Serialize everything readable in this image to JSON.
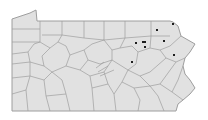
{
  "map": {
    "region": "Pennsylvania counties",
    "fill": "#e1e1e1",
    "border": "#9e9e9e",
    "dot_color": "#1e1e1e",
    "markers": [
      {
        "x": 173,
        "y": 24
      },
      {
        "x": 157,
        "y": 30
      },
      {
        "x": 136,
        "y": 43
      },
      {
        "x": 143,
        "y": 42
      },
      {
        "x": 145,
        "y": 42
      },
      {
        "x": 145,
        "y": 47
      },
      {
        "x": 164,
        "y": 41
      },
      {
        "x": 174,
        "y": 55
      },
      {
        "x": 132,
        "y": 62
      }
    ]
  }
}
